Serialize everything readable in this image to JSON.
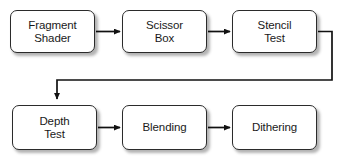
{
  "diagram": {
    "type": "flowchart",
    "canvas": {
      "width": 343,
      "height": 162,
      "background": "#ffffff"
    },
    "style": {
      "node_fill": "#ffffff",
      "node_border": "#2b2b2b",
      "text_color": "#1a1a1a",
      "edge_color": "#1a1a1a",
      "shadow_color": "rgba(0,0,0,0.30)"
    },
    "nodes": [
      {
        "id": "fragment-shader",
        "label": "Fragment\nShader",
        "x": 10,
        "y": 10,
        "w": 85,
        "h": 43
      },
      {
        "id": "scissor-box",
        "label": "Scissor\nBox",
        "x": 122,
        "y": 10,
        "w": 85,
        "h": 43
      },
      {
        "id": "stencil-test",
        "label": "Stencil\nTest",
        "x": 232,
        "y": 10,
        "w": 85,
        "h": 43
      },
      {
        "id": "depth-test",
        "label": "Depth\nTest",
        "x": 12,
        "y": 105,
        "w": 85,
        "h": 45
      },
      {
        "id": "blending",
        "label": "Blending",
        "x": 122,
        "y": 105,
        "w": 85,
        "h": 45
      },
      {
        "id": "dithering",
        "label": "Dithering",
        "x": 232,
        "y": 105,
        "w": 85,
        "h": 45
      }
    ],
    "edges": [
      {
        "id": "edge-fragment-shader-to-scissor-box",
        "from": "fragment-shader",
        "to": "scissor-box",
        "kind": "straight-right"
      },
      {
        "id": "edge-scissor-box-to-stencil-test",
        "from": "scissor-box",
        "to": "stencil-test",
        "kind": "straight-right"
      },
      {
        "id": "edge-stencil-test-to-depth-test",
        "from": "stencil-test",
        "to": "depth-test",
        "kind": "wrap-around-down"
      },
      {
        "id": "edge-depth-test-to-blending",
        "from": "depth-test",
        "to": "blending",
        "kind": "straight-right"
      },
      {
        "id": "edge-blending-to-dithering",
        "from": "blending",
        "to": "dithering",
        "kind": "straight-right"
      }
    ]
  }
}
